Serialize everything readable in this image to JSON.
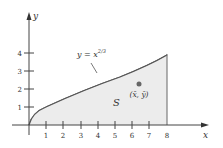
{
  "diagram": {
    "type": "region-under-curve",
    "curve_label": "y = x",
    "curve_exponent": "2/3",
    "region_label": "S",
    "centroid_label": "(x̄, ȳ)",
    "axes": {
      "x_label": "x",
      "y_label": "y",
      "x_ticks": [
        "1",
        "2",
        "3",
        "4",
        "5",
        "6",
        "7",
        "8"
      ],
      "y_ticks": [
        "1",
        "2",
        "3",
        "4"
      ]
    },
    "colors": {
      "fill": "#ececec",
      "curve": "#555555",
      "axis": "#444444",
      "point": "#666666"
    }
  }
}
